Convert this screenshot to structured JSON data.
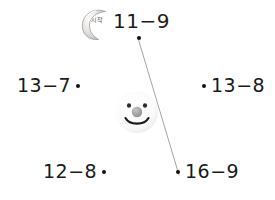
{
  "page": {
    "background_color": "#ffffff",
    "width": 275,
    "height": 200,
    "ink_color": "#1a1a1a"
  },
  "problems": [
    {
      "id": "11-9",
      "expression": "11−9",
      "minuend": 11,
      "subtrahend": 9,
      "answer": 2,
      "dot_position": "below",
      "connected": true
    },
    {
      "id": "13-7",
      "expression": "13−7",
      "minuend": 13,
      "subtrahend": 7,
      "answer": 6,
      "dot_position": "right",
      "connected": false
    },
    {
      "id": "13-8",
      "expression": "13−8",
      "minuend": 13,
      "subtrahend": 8,
      "answer": 5,
      "dot_position": "left",
      "connected": false
    },
    {
      "id": "12-8",
      "expression": "12−8",
      "minuend": 12,
      "subtrahend": 8,
      "answer": 4,
      "dot_position": "right",
      "connected": false
    },
    {
      "id": "16-9",
      "expression": "16−9",
      "minuend": 16,
      "subtrahend": 9,
      "answer": 7,
      "dot_position": "left",
      "connected": true
    }
  ],
  "connector": {
    "from_problem": "11-9",
    "to_problem": "16-9",
    "from_x": 138,
    "from_y": 38,
    "to_x": 179,
    "to_y": 175,
    "stroke_color": "#8d8d8d",
    "stroke_width": 0.8
  },
  "decorations": {
    "moon": {
      "icon": "crescent-moon-icon",
      "caption": "시작",
      "fill_color": "#d8d6d3",
      "outline_color": "#a7a4a0"
    },
    "smiley": {
      "icon": "smiley-face-icon",
      "face_color": "#fcfcfc",
      "eye_color": "#2b2b2b",
      "nose_color": "#9a9a9a",
      "mouth_color": "#1a1a1a"
    }
  }
}
